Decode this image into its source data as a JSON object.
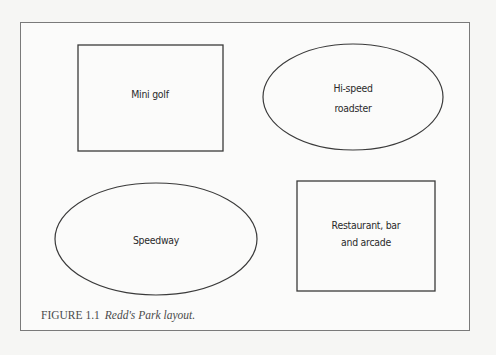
{
  "diagram": {
    "shapes": [
      {
        "id": "mini-golf",
        "type": "rectangle",
        "label_lines": [
          "Mini golf"
        ]
      },
      {
        "id": "hi-speed-roadster",
        "type": "ellipse",
        "label_lines": [
          "Hi-speed",
          "roadster"
        ]
      },
      {
        "id": "speedway",
        "type": "ellipse",
        "label_lines": [
          "Speedway"
        ]
      },
      {
        "id": "restaurant-bar-arcade",
        "type": "rectangle",
        "label_lines": [
          "Restaurant, bar",
          "and arcade"
        ]
      }
    ],
    "caption": {
      "number": "FIGURE 1.1",
      "title": "Redd's Park layout."
    },
    "colors": {
      "stroke": "#3a3a3a",
      "frame": "#7a7a7a",
      "background": "#f6f6f4"
    }
  }
}
